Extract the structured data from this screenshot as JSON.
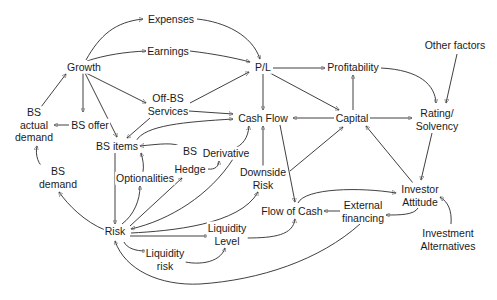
{
  "diagram": {
    "type": "causal-loop",
    "nodes": {
      "expenses": {
        "lines": [
          "Expenses"
        ]
      },
      "earnings": {
        "lines": [
          "Earnings"
        ]
      },
      "growth": {
        "lines": [
          "Growth"
        ]
      },
      "pl": {
        "lines": [
          "P/L"
        ]
      },
      "profitability": {
        "lines": [
          "Profitability"
        ]
      },
      "other_factors": {
        "lines": [
          "Other factors"
        ]
      },
      "off_bs_services": {
        "lines": [
          "Off-BS",
          "Services"
        ]
      },
      "bs_actual_demand": {
        "lines": [
          "BS",
          "actual",
          "demand"
        ]
      },
      "bs_offer": {
        "lines": [
          "BS offer"
        ]
      },
      "cash_flow": {
        "lines": [
          "Cash Flow"
        ]
      },
      "capital": {
        "lines": [
          "Capital"
        ]
      },
      "rating_solvency": {
        "lines": [
          "Rating/",
          "Solvency"
        ]
      },
      "bs_items": {
        "lines": [
          "BS items"
        ]
      },
      "bs_hedge": {
        "lines": [
          "BS",
          "Hedge"
        ]
      },
      "derivative": {
        "lines": [
          "Derivative"
        ]
      },
      "bs_demand": {
        "lines": [
          "BS",
          "demand"
        ]
      },
      "optionalities": {
        "lines": [
          "Optionalities"
        ]
      },
      "downside_risk": {
        "lines": [
          "Downside",
          "Risk"
        ]
      },
      "investor_attitude": {
        "lines": [
          "Investor",
          "Attitude"
        ]
      },
      "external_financing": {
        "lines": [
          "External",
          "financing"
        ]
      },
      "flow_of_cash": {
        "lines": [
          "Flow of Cash"
        ]
      },
      "risk": {
        "lines": [
          "Risk"
        ]
      },
      "liquidity_level": {
        "lines": [
          "Liquidity",
          "Level"
        ]
      },
      "liquidity_risk": {
        "lines": [
          "Liquidity",
          "risk"
        ]
      },
      "investment_alternatives": {
        "lines": [
          "Investment",
          "Alternatives"
        ]
      }
    },
    "edges": [
      {
        "from": "Growth",
        "to": "Expenses"
      },
      {
        "from": "Growth",
        "to": "Earnings"
      },
      {
        "from": "Expenses",
        "to": "P/L"
      },
      {
        "from": "Earnings",
        "to": "P/L"
      },
      {
        "from": "Growth",
        "to": "BS offer"
      },
      {
        "from": "Growth",
        "to": "BS items"
      },
      {
        "from": "Growth",
        "to": "Off-BS Services"
      },
      {
        "from": "BS actual demand",
        "to": "Growth"
      },
      {
        "from": "BS offer",
        "to": "BS actual demand"
      },
      {
        "from": "BS demand",
        "to": "BS actual demand"
      },
      {
        "from": "Off-BS Services",
        "to": "P/L"
      },
      {
        "from": "Off-BS Services",
        "to": "Cash Flow"
      },
      {
        "from": "Off-BS Services",
        "to": "BS items"
      },
      {
        "from": "BS items",
        "to": "Cash Flow"
      },
      {
        "from": "P/L",
        "to": "Profitability"
      },
      {
        "from": "P/L",
        "to": "Cash Flow"
      },
      {
        "from": "P/L",
        "to": "Capital"
      },
      {
        "from": "Capital",
        "to": "Profitability"
      },
      {
        "from": "Capital",
        "to": "Cash Flow"
      },
      {
        "from": "Capital",
        "to": "Rating/Solvency"
      },
      {
        "from": "Profitability",
        "to": "Rating/Solvency"
      },
      {
        "from": "Other factors",
        "to": "Rating/Solvency"
      },
      {
        "from": "Rating/Solvency",
        "to": "Investor Attitude"
      },
      {
        "from": "Investor Attitude",
        "to": "Capital"
      },
      {
        "from": "Investor Attitude",
        "to": "External financing"
      },
      {
        "from": "Investment Alternatives",
        "to": "Investor Attitude"
      },
      {
        "from": "Flow of Cash",
        "to": "Investor Attitude"
      },
      {
        "from": "External financing",
        "to": "Flow of Cash"
      },
      {
        "from": "External financing",
        "to": "Risk"
      },
      {
        "from": "Cash Flow",
        "to": "Flow of Cash"
      },
      {
        "from": "Downside Risk",
        "to": "Cash Flow"
      },
      {
        "from": "Downside Risk",
        "to": "Capital"
      },
      {
        "from": "BS",
        "to": "BS items"
      },
      {
        "from": "Hedge",
        "to": "BS"
      },
      {
        "from": "Hedge",
        "to": "Derivative"
      },
      {
        "from": "Derivative",
        "to": "Cash Flow"
      },
      {
        "from": "Optionalities",
        "to": "BS items"
      },
      {
        "from": "BS items",
        "to": "Risk"
      },
      {
        "from": "Risk",
        "to": "BS demand"
      },
      {
        "from": "Risk",
        "to": "Optionalities"
      },
      {
        "from": "Risk",
        "to": "Hedge"
      },
      {
        "from": "Derivative",
        "to": "Risk"
      },
      {
        "from": "Risk",
        "to": "Downside Risk"
      },
      {
        "from": "Flow of Cash",
        "to": "Risk"
      },
      {
        "from": "Risk",
        "to": "Liquidity Level"
      },
      {
        "from": "Risk",
        "to": "Liquidity risk"
      },
      {
        "from": "Liquidity risk",
        "to": "Liquidity Level"
      },
      {
        "from": "Liquidity Level",
        "to": "Flow of Cash"
      }
    ]
  }
}
